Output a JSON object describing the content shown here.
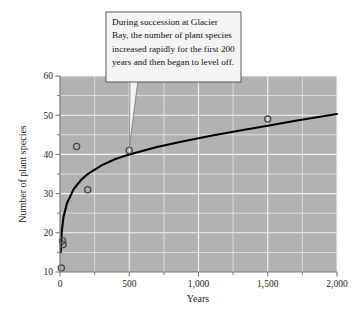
{
  "chart_data": {
    "type": "scatter",
    "title": "",
    "subtitle": "",
    "xlabel": "Years",
    "ylabel": "Number of plant species",
    "xlim": [
      0,
      2000
    ],
    "ylim": [
      10,
      60
    ],
    "grid": true,
    "legend": "none",
    "x_ticks": [
      0,
      500,
      1000,
      1500,
      2000
    ],
    "x_tick_labels": [
      "0",
      "500",
      "1,000",
      "1,500",
      "2,000"
    ],
    "x_minor_ticks": [
      250,
      750,
      1250,
      1750
    ],
    "y_ticks": [
      10,
      20,
      30,
      40,
      50,
      60
    ],
    "y_tick_labels": [
      "10",
      "20",
      "30",
      "40",
      "50",
      "60"
    ],
    "y_minor_ticks": [
      15,
      25,
      35,
      45,
      55
    ],
    "series": [
      {
        "name": "Observed plant species",
        "type": "scatter",
        "marker": "open-circle",
        "points": [
          {
            "x": 10,
            "y": 11
          },
          {
            "x": 18,
            "y": 18
          },
          {
            "x": 22,
            "y": 17
          },
          {
            "x": 120,
            "y": 42
          },
          {
            "x": 200,
            "y": 31
          },
          {
            "x": 500,
            "y": 41
          },
          {
            "x": 1500,
            "y": 49
          }
        ]
      },
      {
        "name": "Logarithmic fit curve",
        "type": "line",
        "points": [
          {
            "x": 5,
            "y": 15
          },
          {
            "x": 12,
            "y": 20
          },
          {
            "x": 25,
            "y": 24
          },
          {
            "x": 50,
            "y": 27.5
          },
          {
            "x": 100,
            "y": 31.2
          },
          {
            "x": 150,
            "y": 33.4
          },
          {
            "x": 200,
            "y": 35
          },
          {
            "x": 300,
            "y": 37.2
          },
          {
            "x": 400,
            "y": 38.8
          },
          {
            "x": 500,
            "y": 40
          },
          {
            "x": 700,
            "y": 41.9
          },
          {
            "x": 900,
            "y": 43.4
          },
          {
            "x": 1100,
            "y": 44.8
          },
          {
            "x": 1300,
            "y": 46.1
          },
          {
            "x": 1500,
            "y": 47.3
          },
          {
            "x": 1700,
            "y": 48.6
          },
          {
            "x": 2000,
            "y": 50.3
          }
        ]
      }
    ],
    "annotations": [
      {
        "name": "succession-callout",
        "text": "During succession at Glacier Bay, the number of plant species increased rapidly for the first 200 years and then began to level off.",
        "points_to": {
          "x": 500,
          "y": 41
        }
      }
    ]
  },
  "colors": {
    "plot_background": "#b2b2b2",
    "gridline": "#f2f2f2",
    "curve": "#000000",
    "marker_stroke": "#4a4a4a",
    "callout_background": "#f4f4f4",
    "callout_border": "#4c4c4c",
    "text": "#111111"
  }
}
